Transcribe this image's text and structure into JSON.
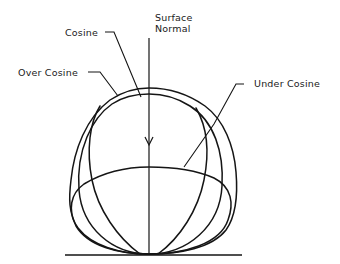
{
  "diagram": {
    "labels": {
      "cosine": "Cosine",
      "over_cosine": "Over Cosine",
      "surface_normal_line1": "Surface",
      "surface_normal_line2": "Normal",
      "under_cosine": "Under Cosine"
    },
    "colors": {
      "ink": "#151515",
      "background": "#ffffff"
    }
  }
}
